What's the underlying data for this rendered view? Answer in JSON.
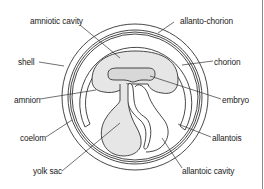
{
  "diagram": {
    "labels": {
      "amniotic_cavity": "amniotic cavity",
      "allanto_chorion": "allanto-chorion",
      "shell": "shell",
      "chorion": "chorion",
      "amnion": "amnion",
      "embryo": "embryo",
      "coelom": "coelom",
      "allantois": "allantois",
      "yolk_sac": "yolk sac",
      "allantoic_cavity": "allantoic cavity"
    },
    "colors": {
      "line": "#333333",
      "fill_stipple": "#e6e6e6",
      "embryo_fill": "#d8d8d8",
      "background": "#ffffff"
    }
  }
}
